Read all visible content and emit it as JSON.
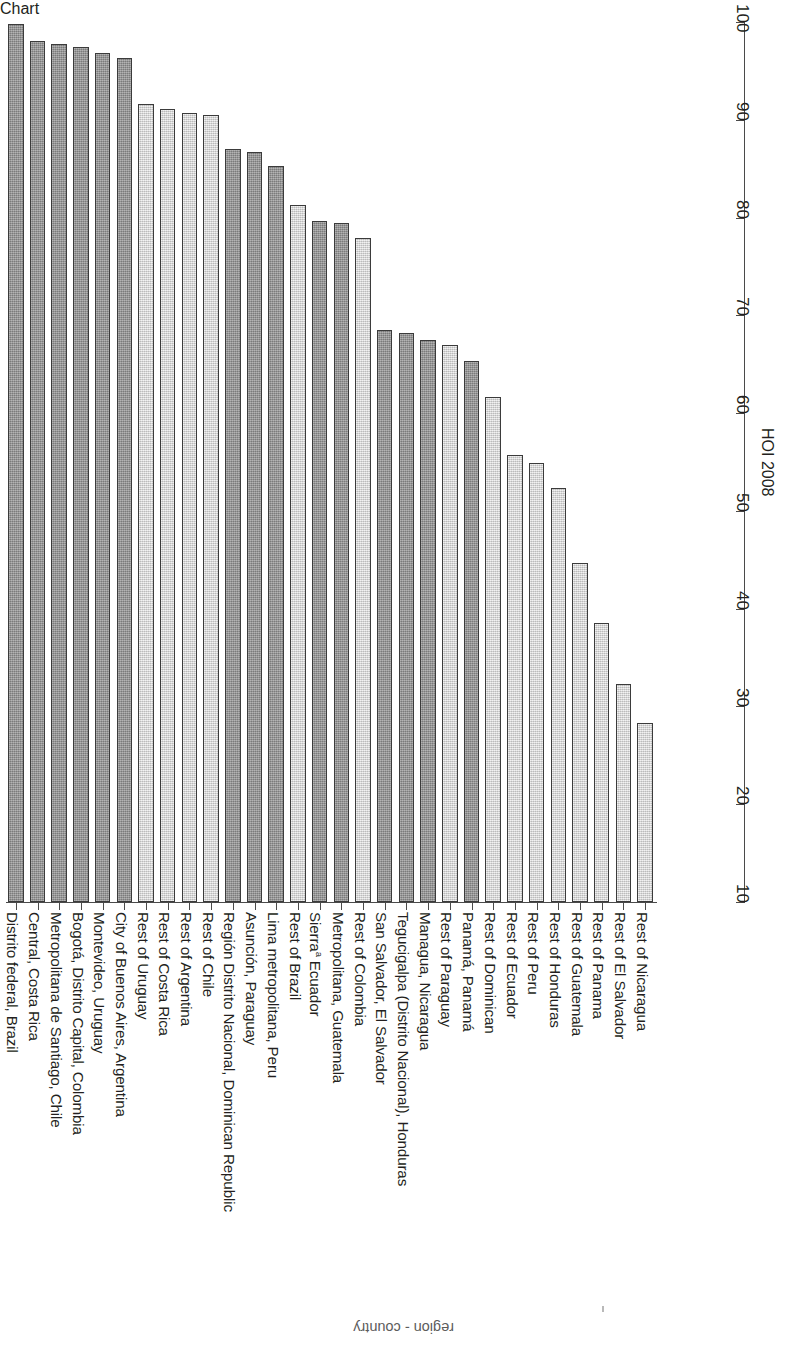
{
  "axes": {
    "value_axis_title": "HOI 2008",
    "value_ticks": [
      "10",
      "20",
      "30",
      "40",
      "50",
      "60",
      "70",
      "80",
      "90",
      "100"
    ],
    "category_axis_title": "region - country"
  },
  "legend": {
    "dark_meaning": "capital / metropolitan region",
    "light_meaning": "rest of country",
    "dark_color": "#979797",
    "light_color": "#e2e2e2"
  },
  "chart_data": {
    "type": "bar",
    "title": "",
    "xlabel": "region - country",
    "ylabel": "HOI 2008",
    "ylim": [
      10,
      100
    ],
    "grid": false,
    "orientation": "vertical-rotated",
    "legend_position": "none",
    "categories": [
      "Distrito federal, Brazil",
      "Central, Costa Rica",
      "Metropolitana de Santiago, Chile",
      "Bogotá, Distrito Capital, Colombia",
      "Montevideo, Uruguay",
      "City of Buenos Aires, Argentina",
      "Rest of Uruguay",
      "Rest of Costa Rica",
      "Rest of Argentina",
      "Rest of Chile",
      "Región Distrito Nacional, Dominican Republic",
      "Asunción, Paraguay",
      "Lima metropolitana, Peru",
      "Rest of Brazil",
      "Sierraᵃ Ecuador",
      "Metropolitana, Guatemala",
      "Rest of Colombia",
      "San Salvador, El Salvador",
      "Tegucigalpa (Distrito Nacional), Honduras",
      "Managua, Nicaragua",
      "Rest of Paraguay",
      "Panamá, Panamá",
      "Rest of Dominican",
      "Rest of Ecuador",
      "Rest of Peru",
      "Rest of Honduras",
      "Rest of Guatemala",
      "Rest of Panama",
      "Rest of El Salvador",
      "Rest of Nicaragua"
    ],
    "values": [
      99.8,
      98.1,
      97.8,
      97.4,
      96.8,
      96.3,
      91.6,
      91.1,
      90.7,
      90.5,
      87.0,
      86.7,
      85.3,
      81.3,
      79.6,
      79.4,
      77.9,
      68.5,
      68.2,
      67.5,
      67.0,
      65.3,
      61.6,
      55.7,
      54.9,
      52.3,
      44.7,
      38.5,
      32.3,
      28.3
    ],
    "shades": [
      "dark",
      "dark",
      "dark",
      "dark",
      "dark",
      "dark",
      "light",
      "light",
      "light",
      "light",
      "dark",
      "dark",
      "dark",
      "light",
      "dark",
      "dark",
      "light",
      "dark",
      "dark",
      "dark",
      "light",
      "dark",
      "light",
      "light",
      "light",
      "light",
      "light",
      "light",
      "light",
      "light"
    ]
  }
}
